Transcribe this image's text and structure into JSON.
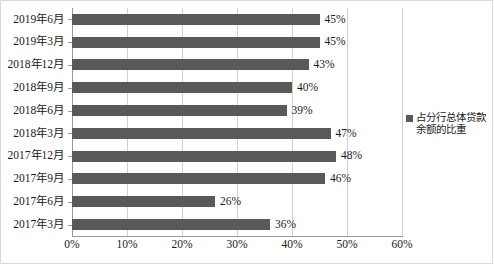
{
  "chart_data": {
    "type": "bar",
    "orientation": "horizontal",
    "title": "",
    "xlabel": "",
    "ylabel": "",
    "xlim": [
      0,
      60
    ],
    "xtick_labels": [
      "0%",
      "10%",
      "20%",
      "30%",
      "40%",
      "50%",
      "60%"
    ],
    "xticks": [
      0,
      10,
      20,
      30,
      40,
      50,
      60
    ],
    "grid": "vertical",
    "legend_position": "right",
    "bar_color": "#595959",
    "gridline_color": "#d0d0d0",
    "axis_color": "#9a9a9a",
    "categories": [
      "2019年6月",
      "2019年3月",
      "2018年12月",
      "2018年9月",
      "2018年6月",
      "2018年3月",
      "2017年12月",
      "2017年9月",
      "2017年6月",
      "2017年3月"
    ],
    "series": [
      {
        "name": "占分行总体贷款余额的比重",
        "values": [
          45,
          45,
          43,
          40,
          39,
          47,
          48,
          46,
          26,
          36
        ],
        "value_labels": [
          "45%",
          "45%",
          "43%",
          "40%",
          "39%",
          "47%",
          "48%",
          "46%",
          "26%",
          "36%"
        ]
      }
    ]
  },
  "legend": {
    "label": "占分行总体贷款余额的比重"
  }
}
